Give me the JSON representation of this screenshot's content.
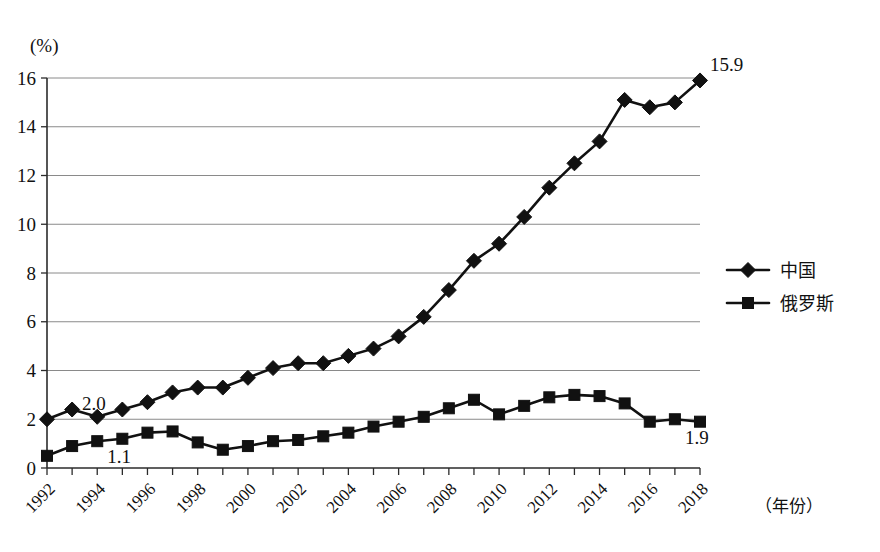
{
  "chart_data": {
    "type": "line",
    "title": "",
    "subtitle": "",
    "xlabel": "（年份）",
    "ylabel": "(%)",
    "ylim": [
      0,
      16
    ],
    "xlim": [
      1992,
      2018
    ],
    "grid": "horizontal",
    "legend_position": "right",
    "ytick_labels": [
      "0",
      "2",
      "4",
      "6",
      "8",
      "10",
      "12",
      "14",
      "16"
    ],
    "ytick_values": [
      0,
      2,
      4,
      6,
      8,
      10,
      12,
      14,
      16
    ],
    "x": [
      1992,
      1993,
      1994,
      1995,
      1996,
      1997,
      1998,
      1999,
      2000,
      2001,
      2002,
      2003,
      2004,
      2005,
      2006,
      2007,
      2008,
      2009,
      2010,
      2011,
      2012,
      2013,
      2014,
      2015,
      2016,
      2017,
      2018
    ],
    "xtick_labels": [
      "1992",
      "1994",
      "1996",
      "1998",
      "2000",
      "2002",
      "2004",
      "2006",
      "2008",
      "2010",
      "2012",
      "2014",
      "2016",
      "2018"
    ],
    "xtick_values": [
      1992,
      1994,
      1996,
      1998,
      2000,
      2002,
      2004,
      2006,
      2008,
      2010,
      2012,
      2014,
      2016,
      2018
    ],
    "series": [
      {
        "name": "中国",
        "marker": "diamond",
        "color": "#111111",
        "values": [
          2.0,
          2.4,
          2.1,
          2.4,
          2.7,
          3.1,
          3.3,
          3.3,
          3.7,
          4.1,
          4.3,
          4.3,
          4.6,
          4.9,
          5.4,
          6.2,
          7.3,
          8.5,
          9.2,
          10.3,
          11.5,
          12.5,
          13.4,
          15.1,
          14.8,
          15.0,
          15.9
        ]
      },
      {
        "name": "俄罗斯",
        "marker": "square",
        "color": "#111111",
        "values": [
          0.5,
          0.9,
          1.1,
          1.2,
          1.45,
          1.5,
          1.05,
          0.75,
          0.9,
          1.1,
          1.15,
          1.3,
          1.45,
          1.7,
          1.9,
          2.1,
          2.45,
          2.8,
          2.2,
          2.55,
          2.9,
          3.0,
          2.95,
          2.65,
          1.9,
          2.0,
          1.9
        ]
      }
    ],
    "annotations": [
      {
        "text": "2.0",
        "series": "中国",
        "x": 1993,
        "value": 2.0,
        "anchor": "start"
      },
      {
        "text": "15.9",
        "series": "中国",
        "x": 2018,
        "value": 15.9,
        "anchor": "start"
      },
      {
        "text": "1.1",
        "series": "俄罗斯",
        "x": 1994,
        "value": 1.1,
        "anchor": "start"
      },
      {
        "text": "1.9",
        "series": "俄罗斯",
        "x": 2017,
        "value": 1.9,
        "anchor": "start"
      }
    ]
  },
  "legend": {
    "items": [
      {
        "label": "中国",
        "marker": "diamond"
      },
      {
        "label": "俄罗斯",
        "marker": "square"
      }
    ]
  }
}
